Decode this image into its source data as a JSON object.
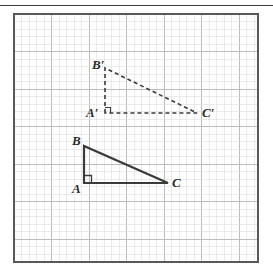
{
  "figure": {
    "top_rule": true,
    "canvas": {
      "width": 273,
      "height": 276,
      "background": "#ffffff"
    },
    "frame": {
      "x": 14,
      "y": 14,
      "width": 244,
      "height": 248,
      "border_color": "#595959",
      "border_width": 2,
      "fill": "#ffffff"
    },
    "grid": {
      "cell_size": 7.5,
      "major_every": 5,
      "minor_color": "#dedede",
      "major_color": "#bcbcbc",
      "minor_width": 0.6,
      "major_width": 1.0
    },
    "styles": {
      "solid_stroke_color": "#3a3a3a",
      "solid_stroke_width": 2.2,
      "dashed_stroke_color": "#3a3a3a",
      "dashed_stroke_width": 1.6,
      "dash_pattern": "4,3",
      "label_color": "#2b2b2b",
      "right_angle_color": "#3a3a3a"
    },
    "shapes": [
      {
        "name": "triangle-abc",
        "kind": "solid",
        "vertices": [
          {
            "id": "A",
            "x": 84,
            "y": 183
          },
          {
            "id": "B",
            "x": 84,
            "y": 146
          },
          {
            "id": "C",
            "x": 168,
            "y": 183
          }
        ],
        "right_angle_at": "A"
      },
      {
        "name": "triangle-a-prime-b-prime-c-prime",
        "kind": "dashed",
        "vertices": [
          {
            "id": "A'",
            "x": 105,
            "y": 113
          },
          {
            "id": "B'",
            "x": 105,
            "y": 68
          },
          {
            "id": "C'",
            "x": 197,
            "y": 113
          }
        ],
        "right_angle_at": "A'"
      }
    ],
    "labels": [
      {
        "id": "label-b-prime",
        "base": "B",
        "prime": "′",
        "x": 92,
        "y": 58
      },
      {
        "id": "label-a-prime",
        "base": "A",
        "prime": "′",
        "x": 86,
        "y": 106
      },
      {
        "id": "label-c-prime",
        "base": "C",
        "prime": "′",
        "x": 202,
        "y": 106
      },
      {
        "id": "label-b",
        "base": "B",
        "prime": "",
        "x": 72,
        "y": 134
      },
      {
        "id": "label-a",
        "base": "A",
        "prime": "",
        "x": 72,
        "y": 182
      },
      {
        "id": "label-c",
        "base": "C",
        "prime": "",
        "x": 172,
        "y": 176
      }
    ]
  }
}
